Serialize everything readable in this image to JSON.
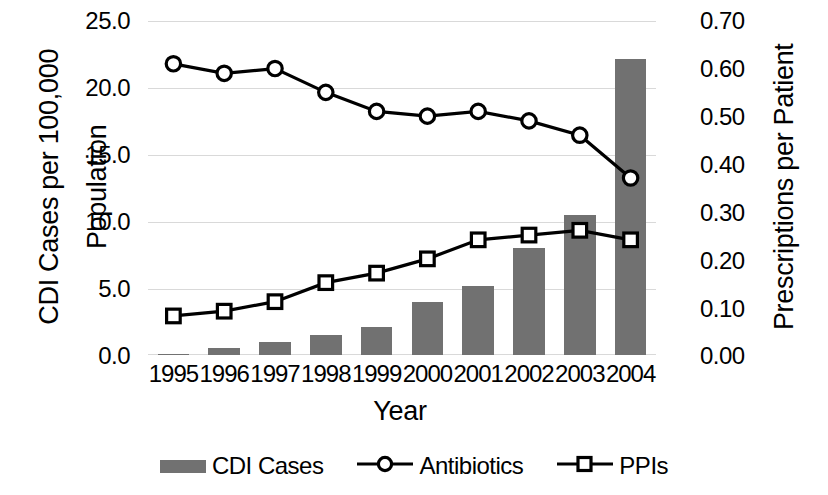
{
  "chart_data": {
    "type": "bar",
    "title": "",
    "xlabel": "Year",
    "ylabel": "CDI Cases per 100,000 Population",
    "ylabel_right": "Prescriptions per Patient",
    "categories": [
      "1995",
      "1996",
      "1997",
      "1998",
      "1999",
      "2000",
      "2001",
      "2002",
      "2003",
      "2004"
    ],
    "ylim": [
      0,
      25
    ],
    "yticks": [
      "0.0",
      "5.0",
      "10.0",
      "15.0",
      "20.0",
      "25.0"
    ],
    "ylim_right": [
      0,
      0.7
    ],
    "yticks_right": [
      "0.00",
      "0.10",
      "0.20",
      "0.30",
      "0.40",
      "0.50",
      "0.60",
      "0.70"
    ],
    "grid": true,
    "legend_position": "bottom",
    "series": [
      {
        "name": "CDI Cases",
        "type": "bar",
        "axis": "left",
        "color": "#717171",
        "values": [
          0.1,
          0.5,
          1.0,
          1.5,
          2.1,
          4.0,
          5.2,
          8.0,
          10.5,
          22.2
        ]
      },
      {
        "name": "Antibiotics",
        "type": "line",
        "marker": "circle",
        "axis": "right",
        "color": "#000000",
        "values": [
          0.61,
          0.59,
          0.6,
          0.55,
          0.51,
          0.5,
          0.51,
          0.49,
          0.46,
          0.37
        ]
      },
      {
        "name": "PPIs",
        "type": "line",
        "marker": "square",
        "axis": "right",
        "color": "#000000",
        "values": [
          0.08,
          0.09,
          0.11,
          0.15,
          0.17,
          0.2,
          0.24,
          0.25,
          0.26,
          0.24
        ]
      }
    ]
  },
  "axes": {
    "y_left_title_line1": "CDI Cases per 100,000",
    "y_left_title_line2": "Population",
    "y_right_title": "Prescriptions per Patient",
    "x_title": "Year",
    "y_left_ticks": [
      "25.0",
      "20.0",
      "15.0",
      "10.0",
      "5.0",
      "0.0"
    ],
    "y_right_ticks": [
      "0.70",
      "0.60",
      "0.50",
      "0.40",
      "0.30",
      "0.20",
      "0.10",
      "0.00"
    ],
    "x_ticks": [
      "1995",
      "1996",
      "1997",
      "1998",
      "1999",
      "2000",
      "2001",
      "2002",
      "2003",
      "2004"
    ]
  },
  "legend": {
    "items": [
      {
        "label": "CDI Cases",
        "marker": "bar-swatch"
      },
      {
        "label": "Antibiotics",
        "marker": "circle-marker"
      },
      {
        "label": "PPIs",
        "marker": "square-marker"
      }
    ]
  }
}
